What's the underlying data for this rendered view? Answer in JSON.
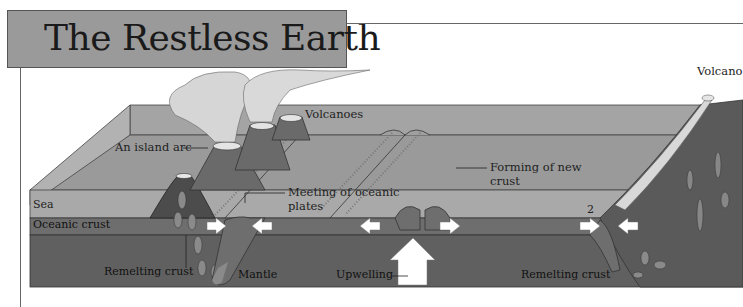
{
  "header": {
    "title": "The Restless Earth"
  },
  "labels": {
    "volcanoes": "Volcanoes",
    "island_arc": "An island arc",
    "sea": "Sea",
    "oceanic_crust": "Oceanic crust",
    "meeting_line1": "Meeting of oceanic",
    "meeting_line2": "plates",
    "forming_line1": "Forming of new",
    "forming_line2": "crust",
    "remelting_left": "Remelting crust",
    "mantle": "Mantle",
    "upwelling": "Upwelling",
    "remelting_right": "Remelting crust",
    "marker_2": "2",
    "volcano_right": "Volcano"
  },
  "colors": {
    "title_bg": "#9a9a9a",
    "sea_top": "#9c9c9c",
    "sea_front": "#a8a8a8",
    "crust": "#6e6e6e",
    "mantle": "#5f5f5f",
    "smoke": "#d4d4d4",
    "arrow": "#ffffff"
  }
}
